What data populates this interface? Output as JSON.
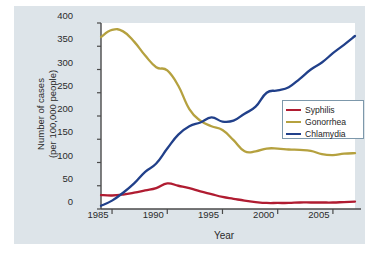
{
  "chart_data": {
    "type": "line",
    "title": "",
    "xlabel": "Year",
    "ylabel_line1": "Number of cases",
    "ylabel_line2": "(per 100,000 people)",
    "xlim": [
      1984,
      2007
    ],
    "ylim": [
      0,
      400
    ],
    "xticks": [
      "1985",
      "1990",
      "1995",
      "2000",
      "2005"
    ],
    "xtick_values": [
      1985,
      1990,
      1995,
      2000,
      2005
    ],
    "yticks": [
      "0",
      "50",
      "100",
      "150",
      "200",
      "250",
      "300",
      "350",
      "400"
    ],
    "ytick_values": [
      0,
      50,
      100,
      150,
      200,
      250,
      300,
      350,
      400
    ],
    "grid": false,
    "legend_position": "center-right",
    "x": [
      1984,
      1985,
      1986,
      1987,
      1988,
      1989,
      1990,
      1991,
      1992,
      1993,
      1994,
      1995,
      1996,
      1997,
      1998,
      1999,
      2000,
      2001,
      2002,
      2003,
      2004,
      2005,
      2006,
      2007
    ],
    "series": [
      {
        "name": "Syphilis",
        "color": "#b01c31",
        "values": [
          30,
          29,
          31,
          35,
          40,
          45,
          55,
          50,
          45,
          38,
          32,
          26,
          22,
          18,
          15,
          13,
          13,
          13,
          14,
          14,
          14,
          14,
          15,
          16
        ]
      },
      {
        "name": "Gonorrhea",
        "color": "#b5a13f",
        "values": [
          370,
          385,
          382,
          360,
          330,
          305,
          298,
          265,
          215,
          190,
          178,
          170,
          148,
          124,
          124,
          130,
          130,
          128,
          127,
          125,
          118,
          116,
          119,
          120
        ]
      },
      {
        "name": "Chlamydia",
        "color": "#21408a",
        "values": [
          7,
          18,
          35,
          55,
          80,
          98,
          130,
          160,
          178,
          186,
          197,
          188,
          190,
          205,
          220,
          250,
          255,
          262,
          280,
          300,
          315,
          335,
          353,
          372
        ]
      }
    ]
  }
}
